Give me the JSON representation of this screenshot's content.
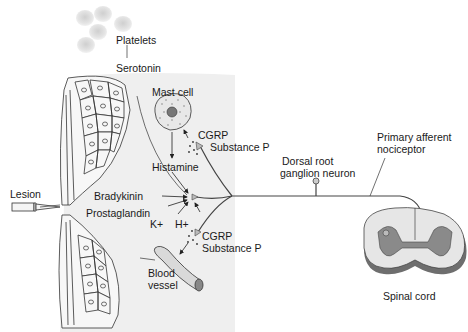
{
  "diagram": {
    "labels": {
      "platelets": "Platelets",
      "serotonin": "Serotonin",
      "mast_cell": "Mast cell",
      "cgrp_top": "CGRP",
      "substance_p_top": "Substance P",
      "histamine": "Histamine",
      "lesion": "Lesion",
      "bradykinin": "Bradykinin",
      "prostaglandin": "Prostaglandin",
      "k_plus": "K+",
      "h_plus": "H+",
      "cgrp_bottom": "CGRP",
      "substance_p_bottom": "Substance P",
      "blood_vessel_1": "Blood",
      "blood_vessel_2": "vessel",
      "dorsal_root_1": "Dorsal root",
      "dorsal_root_2": "ganglion neuron",
      "primary_afferent_1": "Primary afferent",
      "primary_afferent_2": "nociceptor",
      "spinal_cord": "Spinal cord"
    },
    "colors": {
      "tissue_fill": "#ececec",
      "cell_stroke": "#333333",
      "nerve": "#444444",
      "gray_matter": "#8a8a8a",
      "white_matter": "#e6e6e6",
      "platelet": "#dcdcdc"
    }
  }
}
